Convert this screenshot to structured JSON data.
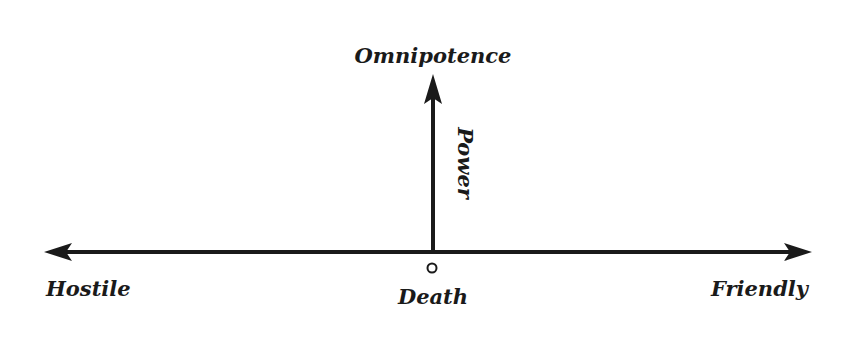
{
  "diagram": {
    "type": "axis-diagram",
    "vertical_axis": {
      "top_label": "Omnipotence",
      "axis_label": "Power",
      "direction": "up"
    },
    "horizontal_axis": {
      "left_label": "Hostile",
      "right_label": "Friendly",
      "direction": "bidirectional"
    },
    "origin": {
      "label": "Death",
      "marker": "circle"
    },
    "colors": {
      "ink": "#1a1a1a",
      "background": "#ffffff"
    }
  }
}
